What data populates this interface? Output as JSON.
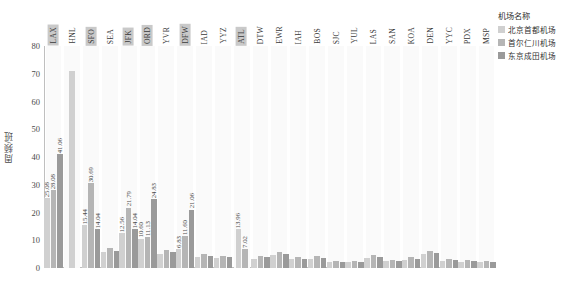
{
  "chart_data": {
    "type": "bar",
    "title": "",
    "xlabel": "",
    "ylabel": "周频/班",
    "ylim": [
      0,
      80
    ],
    "yticks": [
      "0",
      "10",
      "20",
      "30",
      "40",
      "50",
      "60",
      "70",
      "80"
    ],
    "grid": false,
    "legend_position": "top-right",
    "legend_title": "机场名称",
    "categories": [
      "LAX",
      "HNL",
      "SFO",
      "SEA",
      "JFK",
      "ORD",
      "YVR",
      "DFW",
      "IAD",
      "YYZ",
      "ATL",
      "DTW",
      "EWR",
      "IAH",
      "BOS",
      "SJC",
      "YUL",
      "LAS",
      "SAN",
      "KOA",
      "DEN",
      "YYC",
      "PDX",
      "MSP"
    ],
    "highlighted_categories": [
      "LAX",
      "SFO",
      "JFK",
      "ORD",
      "DFW",
      "ATL"
    ],
    "series": [
      {
        "name": "北京首都机场",
        "color": "#d0d0d0",
        "values": [
          25.08,
          71.0,
          15.44,
          5.6,
          12.56,
          10.6,
          5.2,
          6.83,
          4.1,
          3.6,
          13.96,
          3.2,
          4.6,
          3.1,
          3.4,
          2.2,
          2.0,
          3.6,
          2.4,
          3.0,
          5.0,
          2.6,
          2.2,
          2.0
        ]
      },
      {
        "name": "首尔仁川机场",
        "color": "#b5b5b5",
        "values": [
          28.08,
          0,
          30.69,
          7.2,
          21.79,
          11.13,
          6.4,
          11.6,
          5.0,
          4.2,
          7.02,
          4.4,
          5.8,
          4.0,
          4.2,
          2.6,
          2.4,
          4.6,
          3.0,
          3.8,
          6.2,
          3.2,
          2.8,
          2.4
        ]
      },
      {
        "name": "东京成田机场",
        "color": "#9a9a9a",
        "values": [
          41.06,
          0,
          14.04,
          6.0,
          14.04,
          24.83,
          5.6,
          21.06,
          4.4,
          3.8,
          0,
          3.8,
          5.2,
          3.4,
          3.6,
          2.2,
          2.0,
          4.0,
          2.6,
          3.2,
          5.4,
          2.8,
          2.4,
          2.0
        ]
      }
    ],
    "data_labels": {
      "LAX": [
        "25.08",
        "28.08",
        "41.06"
      ],
      "SFO": [
        "15.44",
        "30.69",
        "14.04"
      ],
      "JFK": [
        "12.56",
        "21.79",
        "14.04"
      ],
      "ORD": [
        "10.60",
        "11.13",
        "24.83"
      ],
      "DFW": [
        "6.83",
        "11.60",
        "21.06"
      ],
      "ATL": [
        "13.96",
        "7.02",
        ""
      ]
    }
  },
  "legend": {
    "title": "机场名称",
    "items": [
      {
        "label": "北京首都机场",
        "color": "#d0d0d0"
      },
      {
        "label": "首尔仁川机场",
        "color": "#b5b5b5"
      },
      {
        "label": "东京成田机场",
        "color": "#9a9a9a"
      }
    ]
  }
}
